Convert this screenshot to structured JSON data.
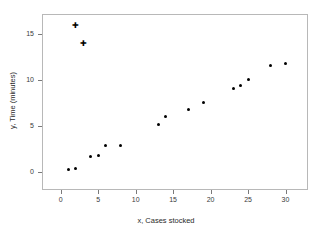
{
  "chart_data": {
    "type": "scatter",
    "title": "",
    "xlabel": "x, Cases stocked",
    "ylabel": "y, Time (minutes)",
    "xlim": [
      -2.5,
      33
    ],
    "ylim": [
      -2.0,
      17.2
    ],
    "xticks": [
      0,
      5,
      10,
      15,
      20,
      25,
      30
    ],
    "xticklabels": [
      "0",
      "5",
      "10",
      "15",
      "20",
      "25",
      "30"
    ],
    "yticks": [
      0,
      5,
      10,
      15
    ],
    "yticklabels": [
      "0",
      "5",
      "10",
      "15"
    ],
    "grid": false,
    "legend": null,
    "series": [
      {
        "name": "observations",
        "marker": "filled-circle",
        "color": "#000000",
        "points": [
          {
            "x": 1,
            "y": 0.2
          },
          {
            "x": 2,
            "y": 0.3
          },
          {
            "x": 4,
            "y": 1.7
          },
          {
            "x": 5,
            "y": 1.8
          },
          {
            "x": 6,
            "y": 2.9
          },
          {
            "x": 8,
            "y": 2.9
          },
          {
            "x": 13,
            "y": 5.1
          },
          {
            "x": 14,
            "y": 6.0
          },
          {
            "x": 17,
            "y": 6.8
          },
          {
            "x": 19,
            "y": 7.5
          },
          {
            "x": 23,
            "y": 9.1
          },
          {
            "x": 24,
            "y": 9.4
          },
          {
            "x": 25,
            "y": 10.1
          },
          {
            "x": 28,
            "y": 11.6
          },
          {
            "x": 30,
            "y": 11.8
          }
        ]
      },
      {
        "name": "outliers",
        "marker": "plus",
        "color": "#000000",
        "points": [
          {
            "x": 2,
            "y": 16.0
          },
          {
            "x": 3,
            "y": 14.0
          }
        ]
      }
    ]
  }
}
